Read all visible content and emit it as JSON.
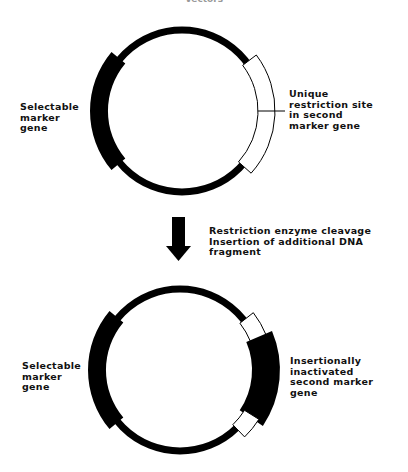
{
  "title": "Vectors",
  "top_plasmid": {
    "left_label": "Selectable\nmarker\ngene",
    "right_label": "Unique\nrestriction site\nin second\nmarker gene"
  },
  "step": {
    "label": "Restriction enzyme cleavage\nInsertion of additional DNA\nfragment",
    "arrow_icon": "down-arrow"
  },
  "bottom_plasmid": {
    "left_label": "Selectable\nmarker\ngene",
    "right_label": "Insertionally\ninactivated\nsecond marker\ngene"
  },
  "colors": {
    "ring": "#000000",
    "marker_fill": "#000000",
    "site_fill": "#ffffff",
    "text": "#111111"
  }
}
